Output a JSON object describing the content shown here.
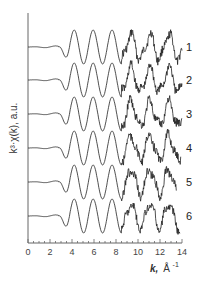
{
  "chart_data": {
    "type": "line",
    "title": "",
    "xlabel": "k, Å⁻¹",
    "ylabel": "k³·χ(k), a.u.",
    "xlim": [
      0,
      14
    ],
    "xticks": [
      0,
      2,
      4,
      6,
      8,
      10,
      12,
      14
    ],
    "xtick_labels": [
      "0",
      "2",
      "4",
      "6",
      "8",
      "10",
      "12",
      "14"
    ],
    "minor_ticks_per_major": 4,
    "grid": false,
    "legend": "inline labels at right end of each curve",
    "stacked_offset": true,
    "series": [
      {
        "name": "1",
        "label": "1",
        "x_start": 0.0,
        "x_end": 14.0,
        "color": "#222222"
      },
      {
        "name": "2",
        "label": "2",
        "x_start": 0.0,
        "x_end": 14.0,
        "color": "#222222"
      },
      {
        "name": "3",
        "label": "3",
        "x_start": 0.0,
        "x_end": 14.0,
        "color": "#222222"
      },
      {
        "name": "4",
        "label": "4",
        "x_start": 0.0,
        "x_end": 13.9,
        "color": "#222222"
      },
      {
        "name": "5",
        "label": "5",
        "x_start": 0.0,
        "x_end": 13.5,
        "color": "#222222"
      },
      {
        "name": "6",
        "label": "6",
        "x_start": 0.0,
        "x_end": 13.8,
        "color": "#222222"
      }
    ],
    "features": {
      "main_peaks_k": [
        4.2,
        5.9,
        7.6
      ],
      "main_minima_k": [
        3.3,
        5.1,
        6.8,
        8.2
      ],
      "noisy_region_k": [
        8.5,
        14.0
      ]
    }
  },
  "axis": {
    "x_title_k": "k,",
    "x_title_unit": "Å",
    "x_title_exp": "-1",
    "y_title": "k³·χ(k), a.u."
  }
}
